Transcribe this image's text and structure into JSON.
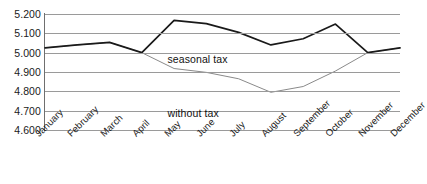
{
  "chart_data": {
    "type": "line",
    "title": "",
    "xlabel": "",
    "ylabel": "",
    "ylim": [
      4.6,
      5.2
    ],
    "ytick_step": 0.1,
    "grid": true,
    "legend_position": "inline-annotation",
    "ytick_labels": [
      "5.200",
      "5.100",
      "5.000",
      "4.900",
      "4.800",
      "4.700",
      "4.600"
    ],
    "ytick_values": [
      5.2,
      5.1,
      5.0,
      4.9,
      4.8,
      4.7,
      4.6
    ],
    "categories": [
      "January",
      "February",
      "March",
      "April",
      "May",
      "June",
      "July",
      "August",
      "September",
      "October",
      "November",
      "December"
    ],
    "series": [
      {
        "name": "seasonal tax",
        "color": "#1a1a1a",
        "width": 1.7,
        "values": [
          5.025,
          5.04,
          5.053,
          5.0,
          5.167,
          5.15,
          5.105,
          5.04,
          5.072,
          5.148,
          5.0,
          5.025
        ]
      },
      {
        "name": "without tax",
        "color": "#8a8a8a",
        "width": 1.0,
        "values": [
          5.025,
          5.04,
          5.053,
          5.0,
          4.918,
          4.898,
          4.865,
          4.795,
          4.825,
          4.905,
          5.0,
          5.025
        ]
      }
    ],
    "annotations": [
      {
        "text": "seasonal tax",
        "series": "seasonal tax"
      },
      {
        "text": "without tax",
        "series": "without tax"
      }
    ]
  }
}
